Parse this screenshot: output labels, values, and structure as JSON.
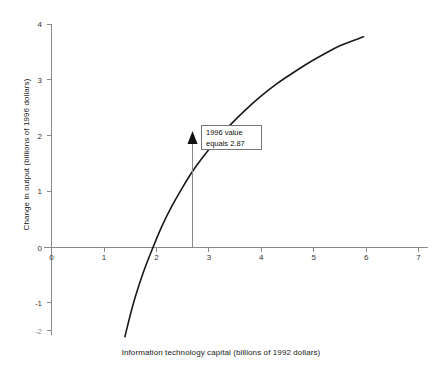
{
  "chart_data": {
    "type": "line",
    "title": "",
    "xlabel": "Information technology capital (billions of 1992 dollars)",
    "ylabel": "Change in output (billions of 1996 dollars)",
    "xlim": [
      0,
      7
    ],
    "ylim": [
      -2,
      4
    ],
    "x_ticks": [
      0,
      1,
      2,
      3,
      4,
      5,
      6,
      7
    ],
    "x_tick_labels": [
      "0",
      "1",
      "2",
      "3",
      "4",
      "5",
      "6",
      "7"
    ],
    "y_ticks": [
      -2,
      -1,
      0,
      1,
      2,
      3,
      4
    ],
    "y_tick_labels": [
      "-2",
      "-1",
      "0",
      "1",
      "2",
      "3",
      "4"
    ],
    "grid": false,
    "legend": "none",
    "series": [
      {
        "name": "Change in output",
        "x": [
          1.4,
          1.5,
          1.6,
          1.75,
          1.9,
          2.1,
          2.3,
          2.5,
          2.7,
          2.87,
          3.1,
          3.4,
          3.7,
          4.0,
          4.3,
          4.6,
          4.9,
          5.2,
          5.5,
          5.95
        ],
        "y": [
          -1.6,
          -1.22,
          -0.88,
          -0.45,
          -0.08,
          0.37,
          0.75,
          1.08,
          1.38,
          1.6,
          1.87,
          2.19,
          2.47,
          2.72,
          2.94,
          3.13,
          3.31,
          3.47,
          3.62,
          3.78
        ]
      }
    ],
    "zero_crossing_x": 1.78,
    "annotations": [
      {
        "name": "1996-value-callout",
        "line1": "1996 value",
        "line2": "equals 2.87",
        "point_x": 2.87,
        "point_y": 1.97,
        "leader_to_y": 0
      }
    ]
  },
  "colors": {
    "curve": "#1a1a1a",
    "axis": "#8a8a8a",
    "text": "#222222",
    "callout_border": "#777777",
    "background": "#ffffff"
  }
}
